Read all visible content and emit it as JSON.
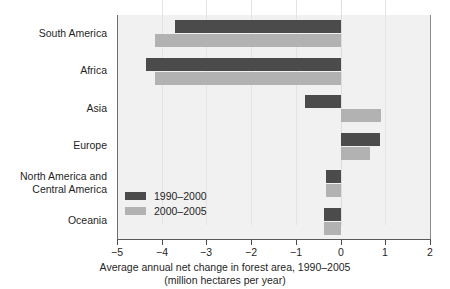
{
  "chart_data": {
    "type": "bar",
    "orientation": "horizontal",
    "title": "",
    "xlabel": "Average annual net change in forest area, 1990–2005",
    "xlabel_line2": "(million hectares per year)",
    "ylabel": "",
    "categories": [
      "South America",
      "Africa",
      "Asia",
      "Europe",
      "North America and\nCentral America",
      "Oceania"
    ],
    "categories_display": [
      {
        "line1": "South America",
        "line2": ""
      },
      {
        "line1": "Africa",
        "line2": ""
      },
      {
        "line1": "Asia",
        "line2": ""
      },
      {
        "line1": "Europe",
        "line2": ""
      },
      {
        "line1": "North America and",
        "line2": "Central America"
      },
      {
        "line1": "Oceania",
        "line2": ""
      }
    ],
    "series": [
      {
        "name": "1990–2000",
        "color": "#4b4b4b",
        "values": [
          -3.71,
          -4.35,
          -0.79,
          0.88,
          -0.33,
          -0.37
        ]
      },
      {
        "name": "2000–2005",
        "color": "#b2b2b2",
        "values": [
          -4.14,
          -4.16,
          0.9,
          0.66,
          -0.33,
          -0.36
        ]
      }
    ],
    "xlim": [
      -5,
      2
    ],
    "xticks": [
      -5,
      -4,
      -3,
      -2,
      -1,
      0,
      1,
      2
    ],
    "xticklabels": [
      "−5",
      "−4",
      "−3",
      "−2",
      "−1",
      "0",
      "1",
      "2"
    ],
    "grid": "vertical-light",
    "legend_position": "inside-bottom-left",
    "plot_background": "#f1f1f1"
  }
}
